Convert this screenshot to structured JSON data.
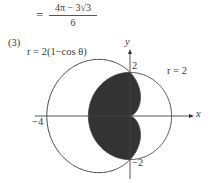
{
  "equation": {
    "equals": "=",
    "numerator": "4π − 3√3",
    "denominator": "6"
  },
  "part_label": "(3)",
  "cardioid_label": "r = 2(1−cos θ)",
  "circle_label": "r = 2",
  "axes": {
    "x_label": "x",
    "y_label": "y",
    "tick_y_pos": "2",
    "tick_y_neg": "−2",
    "tick_x_neg": "−4"
  },
  "geometry": {
    "origin": [
      130,
      116
    ],
    "unit_x": 20.8,
    "unit_y": 21.8,
    "circle_radius": 2,
    "cardioid_a": 2,
    "x_axis": [
      35,
      194
    ],
    "y_axis": [
      49,
      179
    ]
  },
  "colors": {
    "stroke": "#444444",
    "fill": "#333333",
    "background": "#ffffff"
  }
}
